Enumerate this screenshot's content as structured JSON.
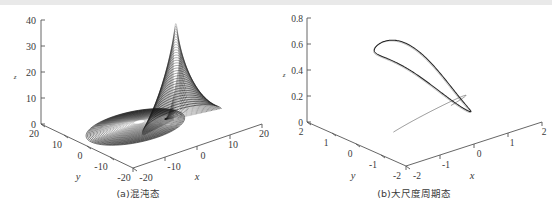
{
  "figure": {
    "panels": [
      {
        "id": "a",
        "caption": "(a)混沌态",
        "zlabel": "z",
        "ylabel": "y",
        "xlabel": "x",
        "z_ticks": [
          "40",
          "30",
          "20",
          "10",
          "0"
        ],
        "y_ticks": [
          "20",
          "10",
          "0",
          "-10",
          "-20"
        ],
        "x_ticks": [
          "-20",
          "-10",
          "0",
          "10",
          "20"
        ]
      },
      {
        "id": "b",
        "caption": "(b)大尺度周期态",
        "zlabel": "z",
        "ylabel": "y",
        "xlabel": "x",
        "z_ticks": [
          "0.8",
          "0.6",
          "0.4",
          "0.2",
          "0"
        ],
        "y_ticks": [
          "2",
          "1",
          "0",
          "-1",
          "-2"
        ],
        "x_ticks": [
          "-2",
          "-1",
          "0",
          "1",
          "2"
        ]
      }
    ]
  },
  "chart_data": [
    {
      "type": "line",
      "title": "(a)混沌态",
      "subtitle": "chaotic state 3D phase portrait",
      "projection": "3d",
      "xlabel": "x",
      "ylabel": "y",
      "zlabel": "z",
      "xlim": [
        -20,
        20
      ],
      "ylim": [
        -20,
        20
      ],
      "zlim": [
        0,
        40
      ],
      "xticks": [
        -20,
        -10,
        0,
        10,
        20
      ],
      "yticks": [
        -20,
        -10,
        0,
        10,
        20
      ],
      "zticks": [
        0,
        10,
        20,
        30,
        40
      ],
      "grid": false,
      "legend": false,
      "series": [
        {
          "name": "chaotic attractor trajectory",
          "description": "Dense chaotic orbit: a flat spiral disk of nested ellipses near z=0 centred about (x,y)=(-5,0), plus a tall narrow peak of nested arcs rising to z=38 at x=5",
          "line_color": "#1a1a1a",
          "line_width": 0.4,
          "features": {
            "disk_center_x": -5,
            "disk_center_y": 0,
            "disk_radius_x": 13,
            "disk_radius_y": 9,
            "disk_z": 1,
            "peak_x": 5,
            "peak_y": -4,
            "peak_z_max": 38,
            "n_loops": 34
          }
        }
      ]
    },
    {
      "type": "line",
      "title": "(b)大尺度周期态",
      "subtitle": "large-scale periodic state 3D phase portrait",
      "projection": "3d",
      "xlabel": "x",
      "ylabel": "y",
      "zlabel": "z",
      "xlim": [
        -2,
        2
      ],
      "ylim": [
        -2,
        2
      ],
      "zlim": [
        0,
        0.8
      ],
      "xticks": [
        -2,
        -1,
        0,
        1,
        2
      ],
      "yticks": [
        -2,
        -1,
        0,
        1,
        2
      ],
      "zticks": [
        0,
        0.2,
        0.4,
        0.6,
        0.8
      ],
      "grid": false,
      "legend": false,
      "series": [
        {
          "name": "periodic orbit",
          "description": "Single closed dome-shaped limit cycle peaking near z=0.8, with a thin inner return arc near z=0.2",
          "line_color": "#1a1a1a",
          "line_width": 1.0,
          "features": {
            "peak_z": 0.8,
            "inner_arc_z": 0.2,
            "closed": true,
            "n_loops": 1
          }
        }
      ]
    }
  ]
}
